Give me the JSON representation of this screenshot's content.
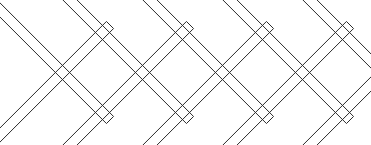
{
  "figure": {
    "width": 371,
    "height": 145,
    "background_color": "#ffffff",
    "stroke_color": "#2b2b2b",
    "fill_color": "#ffffff",
    "stroke_width": 1,
    "slat_width": 10,
    "slat_end_style": "square-cut",
    "crossing_style": "outlines-pass-through",
    "slat_angles_deg": [
      -45,
      45
    ],
    "counts": {
      "descending_slats": 5,
      "ascending_slats": 5,
      "total_slats": 10,
      "diamond_openings": 7
    },
    "apex_points": {
      "top_y": 12,
      "bottom_y": 133,
      "top_x": [
        68,
        148,
        228,
        308
      ],
      "bottom_x": [
        28,
        108,
        188,
        268,
        348
      ],
      "spacing_x": 80
    }
  },
  "slats": [
    {
      "name": "descending-slat-1",
      "direction": "descending",
      "x1": 30,
      "y1": -40,
      "x2": 190,
      "y2": 120
    },
    {
      "name": "descending-slat-2",
      "direction": "descending",
      "x1": 110,
      "y1": -40,
      "x2": 270,
      "y2": 120
    },
    {
      "name": "descending-slat-3",
      "direction": "descending",
      "x1": 190,
      "y1": -40,
      "x2": 350,
      "y2": 120
    },
    {
      "name": "descending-slat-4",
      "direction": "descending",
      "x1": 270,
      "y1": -40,
      "x2": 430,
      "y2": 120
    },
    {
      "name": "descending-slat-5",
      "direction": "descending",
      "x1": -50,
      "y1": -40,
      "x2": 110,
      "y2": 120
    },
    {
      "name": "ascending-slat-1",
      "direction": "ascending",
      "x1": 30,
      "y1": 185,
      "x2": 190,
      "y2": 25
    },
    {
      "name": "ascending-slat-2",
      "direction": "ascending",
      "x1": 110,
      "y1": 185,
      "x2": 270,
      "y2": 25
    },
    {
      "name": "ascending-slat-3",
      "direction": "ascending",
      "x1": 190,
      "y1": 185,
      "x2": 350,
      "y2": 25
    },
    {
      "name": "ascending-slat-4",
      "direction": "ascending",
      "x1": 270,
      "y1": 185,
      "x2": 430,
      "y2": 25
    },
    {
      "name": "ascending-slat-5",
      "direction": "ascending",
      "x1": -50,
      "y1": 185,
      "x2": 110,
      "y2": 25
    }
  ]
}
